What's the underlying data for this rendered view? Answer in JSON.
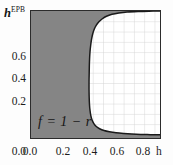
{
  "chart_data": {
    "type": "area",
    "title": "",
    "subtitle": "",
    "xlabel": "h",
    "ylabel": "h",
    "ylabel_superscript": "EPB",
    "xticks": [
      "0.0",
      "0.2",
      "0.4",
      "0.6",
      "0.8"
    ],
    "xtick_values": [
      0.0,
      0.2,
      0.4,
      0.6,
      0.8
    ],
    "yticks": [
      "0.0",
      "0.2",
      "0.4",
      "0.6"
    ],
    "ytick_values": [
      0.0,
      0.2,
      0.4,
      0.6
    ],
    "xlim": [
      0.0,
      0.94
    ],
    "ylim": [
      0.0,
      0.92
    ],
    "grid": true,
    "grid_color": "#d3d3d3",
    "grid_spacing_x": 0.075,
    "grid_spacing_y": 0.075,
    "legend": "none",
    "annotations": [
      {
        "text": "f = 1 − r",
        "x": 0.06,
        "y": 0.1
      }
    ],
    "regions": [
      {
        "name": "shaded-region",
        "fill": "#858585",
        "description": "Shaded region left of and below the boundary curve"
      },
      {
        "name": "unshaded-region",
        "fill": "#ffffff",
        "description": "White gridded region right of and above the boundary curve"
      }
    ],
    "series": [
      {
        "name": "boundary-curve",
        "type": "line",
        "color": "#1a1a1a",
        "x": [
          0.94,
          0.86,
          0.78,
          0.7,
          0.64,
          0.59,
          0.55,
          0.52,
          0.495,
          0.475,
          0.46,
          0.449,
          0.441,
          0.435,
          0.43,
          0.427,
          0.425,
          0.424,
          0.423,
          0.423,
          0.424,
          0.426,
          0.43,
          0.436,
          0.445,
          0.458,
          0.476,
          0.5,
          0.532,
          0.572,
          0.62,
          0.675,
          0.735,
          0.8,
          0.87,
          0.94
        ],
        "y": [
          0.92,
          0.919,
          0.917,
          0.913,
          0.906,
          0.896,
          0.882,
          0.864,
          0.842,
          0.816,
          0.786,
          0.752,
          0.714,
          0.672,
          0.626,
          0.576,
          0.522,
          0.466,
          0.408,
          0.35,
          0.295,
          0.245,
          0.2,
          0.162,
          0.13,
          0.104,
          0.083,
          0.067,
          0.054,
          0.045,
          0.038,
          0.033,
          0.029,
          0.026,
          0.024,
          0.023
        ]
      }
    ]
  },
  "colors": {
    "shaded": "#858585",
    "plot_background": "#ffffff",
    "frame": "#2b2b2b",
    "grid": "#d3d3d3",
    "curve": "#1a1a1a",
    "text": "#1c1c1c"
  }
}
